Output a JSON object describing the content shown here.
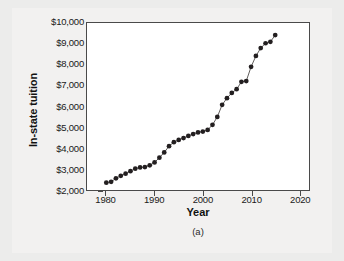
{
  "chart_data": {
    "type": "scatter",
    "title": "",
    "xlabel": "Year",
    "ylabel": "In-state tuition",
    "caption": "(a)",
    "xlim": [
      1976,
      2022
    ],
    "ylim": [
      2000,
      10000
    ],
    "xticks": [
      1980,
      1990,
      2000,
      2010,
      2020
    ],
    "xticklabels": [
      "1980",
      "1990",
      "2000",
      "2010",
      "2020"
    ],
    "yticks": [
      2000,
      3000,
      4000,
      5000,
      6000,
      7000,
      8000,
      9000,
      10000
    ],
    "yticklabels": [
      "$2,000",
      "$3,000",
      "$4,000",
      "$5,000",
      "$6,000",
      "$7,000",
      "$8,000",
      "$9,000",
      "$10,000"
    ],
    "grid": false,
    "legend": null,
    "marker": "filled-circle",
    "marker_color": "#231f20",
    "line_color": "#4d4a48",
    "x": [
      1980,
      1981,
      1982,
      1983,
      1984,
      1985,
      1986,
      1987,
      1988,
      1989,
      1990,
      1991,
      1992,
      1993,
      1994,
      1995,
      1996,
      1997,
      1998,
      1999,
      2000,
      2001,
      2002,
      2003,
      2004,
      2005,
      2006,
      2007,
      2008,
      2009,
      2010,
      2011,
      2012,
      2013,
      2014,
      2015
    ],
    "values": [
      2350,
      2390,
      2560,
      2680,
      2780,
      2900,
      3020,
      3080,
      3100,
      3180,
      3320,
      3550,
      3800,
      4100,
      4290,
      4400,
      4490,
      4590,
      4680,
      4760,
      4800,
      4880,
      5120,
      5500,
      6080,
      6400,
      6650,
      6830,
      7180,
      7220,
      7900,
      8420,
      8800,
      9030,
      9100,
      9420
    ],
    "series": [
      {
        "name": "In-state tuition",
        "values": [
          2350,
          2390,
          2560,
          2680,
          2780,
          2900,
          3020,
          3080,
          3100,
          3180,
          3320,
          3550,
          3800,
          4100,
          4290,
          4400,
          4490,
          4590,
          4680,
          4760,
          4800,
          4880,
          5120,
          5500,
          6080,
          6400,
          6650,
          6830,
          7180,
          7220,
          7900,
          8420,
          8800,
          9030,
          9100,
          9420
        ]
      }
    ]
  },
  "colors": {
    "page_background": "#ececeb",
    "plot_background": "#ffffff",
    "axis": "#4a4a4a",
    "marker": "#231f20",
    "text": "#1a1a1a"
  }
}
